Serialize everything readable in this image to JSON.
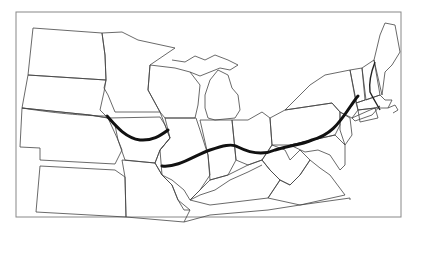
{
  "map": {
    "type": "outline-map",
    "region": "Northeastern and Midwestern United States",
    "colors": {
      "background": "#ffffff",
      "borders": "#444444",
      "highlight_line": "#111111",
      "frame": "#888888"
    },
    "features": [
      {
        "name": "state-borders",
        "style": "thin"
      },
      {
        "name": "northern-thick-line",
        "style": "thick",
        "description": "curve through Nebraska/Iowa"
      },
      {
        "name": "southern-thick-line",
        "style": "thick",
        "description": "curve from Missouri across to New England"
      },
      {
        "name": "new-england-line",
        "style": "medium",
        "description": "line through New Hampshire/Massachusetts"
      }
    ]
  }
}
